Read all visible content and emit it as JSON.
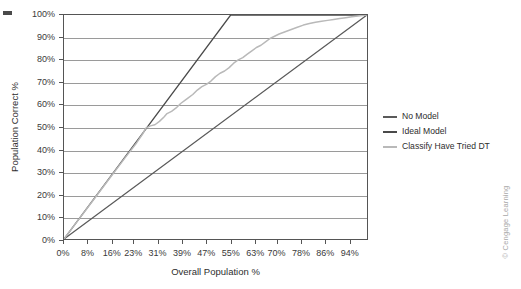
{
  "figure": {
    "watermark": "© Cengage Learning"
  },
  "chart_data": {
    "type": "line",
    "title": "",
    "xlabel": "Overall Population %",
    "ylabel": "Population Correct %",
    "xlim": [
      0,
      100
    ],
    "ylim": [
      0,
      100
    ],
    "grid": "horizontal",
    "legend_position": "right",
    "x_tick_labels": [
      "0%",
      "8%",
      "16%",
      "23%",
      "31%",
      "39%",
      "47%",
      "55%",
      "63%",
      "70%",
      "78%",
      "86%",
      "94%"
    ],
    "x_tick_values": [
      0,
      8,
      16,
      23,
      31,
      39,
      47,
      55,
      63,
      70,
      78,
      86,
      94
    ],
    "y_tick_labels": [
      "0%",
      "10%",
      "20%",
      "30%",
      "40%",
      "50%",
      "60%",
      "70%",
      "80%",
      "90%",
      "100%"
    ],
    "y_tick_values": [
      0,
      10,
      20,
      30,
      40,
      50,
      60,
      70,
      80,
      90,
      100
    ],
    "series": [
      {
        "name": "No Model",
        "color": "#5a5a5a",
        "width": 1.3,
        "points": [
          [
            0,
            0
          ],
          [
            100,
            100
          ]
        ]
      },
      {
        "name": "Ideal Model",
        "color": "#4a4a4a",
        "width": 1.3,
        "points": [
          [
            0,
            0
          ],
          [
            55,
            100
          ],
          [
            100,
            100
          ]
        ]
      },
      {
        "name": "Classify Have Tried DT",
        "color": "#b9b9b9",
        "width": 1.5,
        "points": [
          [
            0,
            0
          ],
          [
            5,
            9
          ],
          [
            10,
            18
          ],
          [
            15,
            27
          ],
          [
            20,
            36
          ],
          [
            24,
            43
          ],
          [
            26,
            47
          ],
          [
            27,
            49.5
          ],
          [
            28.5,
            50.5
          ],
          [
            30,
            51
          ],
          [
            31.5,
            52.5
          ],
          [
            33,
            54.5
          ],
          [
            34,
            56
          ],
          [
            35.5,
            57
          ],
          [
            37,
            58.5
          ],
          [
            38.5,
            60.5
          ],
          [
            40,
            62
          ],
          [
            41,
            63
          ],
          [
            42.5,
            64.5
          ],
          [
            44,
            66.5
          ],
          [
            45.5,
            68
          ],
          [
            47,
            69
          ],
          [
            48.5,
            70.5
          ],
          [
            50,
            72.5
          ],
          [
            51.5,
            74
          ],
          [
            53,
            75
          ],
          [
            54.5,
            76.5
          ],
          [
            56,
            78.5
          ],
          [
            57.5,
            80
          ],
          [
            59,
            81
          ],
          [
            60.5,
            82.5
          ],
          [
            62,
            84
          ],
          [
            63.5,
            85.5
          ],
          [
            65,
            86.5
          ],
          [
            66.5,
            88
          ],
          [
            68,
            89.5
          ],
          [
            69.5,
            90.5
          ],
          [
            71,
            91.5
          ],
          [
            73,
            92.5
          ],
          [
            75,
            93.5
          ],
          [
            77,
            94.5
          ],
          [
            79,
            95.5
          ],
          [
            81,
            96.2
          ],
          [
            83,
            96.8
          ],
          [
            85,
            97.2
          ],
          [
            87,
            97.6
          ],
          [
            89,
            98
          ],
          [
            91,
            98.4
          ],
          [
            93,
            98.8
          ],
          [
            95,
            99.2
          ],
          [
            97,
            99.6
          ],
          [
            100,
            100
          ]
        ]
      }
    ]
  }
}
